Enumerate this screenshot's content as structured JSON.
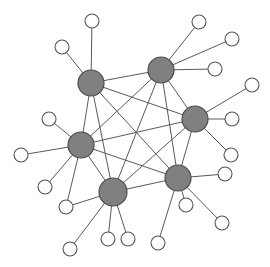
{
  "figure": {
    "title": "",
    "type": "network-graph",
    "width": 270,
    "height": 267,
    "background_color": "#ffffff"
  },
  "style": {
    "hub_fill": "#808080",
    "hub_stroke": "#4d4d4d",
    "hub_stroke_width": 1.2,
    "hub_radius": 13,
    "leaf_fill": "#ffffff",
    "leaf_stroke": "#555555",
    "leaf_stroke_width": 1.1,
    "leaf_radius": 7,
    "edge_color": "#595959",
    "edge_width": 1
  },
  "chart_data": {
    "type": "network",
    "title": "",
    "xlabel": "",
    "ylabel": "",
    "grid": false,
    "legend": "none",
    "xlim": [
      0,
      270
    ],
    "ylim": [
      0,
      267
    ],
    "node_count": 25,
    "hub_count": 6,
    "leaf_count": 19,
    "nodes": [
      {
        "id": "H1",
        "kind": "hub",
        "x": 91,
        "y": 83,
        "r": 13
      },
      {
        "id": "H2",
        "kind": "hub",
        "x": 161,
        "y": 70,
        "r": 13
      },
      {
        "id": "H3",
        "kind": "hub",
        "x": 195,
        "y": 119,
        "r": 13
      },
      {
        "id": "H4",
        "kind": "hub",
        "x": 81,
        "y": 145,
        "r": 13
      },
      {
        "id": "H5",
        "kind": "hub",
        "x": 113,
        "y": 192,
        "r": 14
      },
      {
        "id": "H6",
        "kind": "hub",
        "x": 178,
        "y": 178,
        "r": 13
      },
      {
        "id": "L1",
        "kind": "leaf",
        "x": 92,
        "y": 21,
        "r": 7
      },
      {
        "id": "L2",
        "kind": "leaf",
        "x": 62,
        "y": 47,
        "r": 7
      },
      {
        "id": "L3",
        "kind": "leaf",
        "x": 199,
        "y": 22,
        "r": 7
      },
      {
        "id": "L4",
        "kind": "leaf",
        "x": 232,
        "y": 39,
        "r": 7
      },
      {
        "id": "L5",
        "kind": "leaf",
        "x": 215,
        "y": 69,
        "r": 7
      },
      {
        "id": "L6",
        "kind": "leaf",
        "x": 252,
        "y": 85,
        "r": 7
      },
      {
        "id": "L7",
        "kind": "leaf",
        "x": 232,
        "y": 119,
        "r": 7
      },
      {
        "id": "L8",
        "kind": "leaf",
        "x": 231,
        "y": 155,
        "r": 7
      },
      {
        "id": "L9",
        "kind": "leaf",
        "x": 225,
        "y": 174,
        "r": 7
      },
      {
        "id": "L10",
        "kind": "leaf",
        "x": 222,
        "y": 223,
        "r": 7
      },
      {
        "id": "L11",
        "kind": "leaf",
        "x": 158,
        "y": 243,
        "r": 7
      },
      {
        "id": "L12",
        "kind": "leaf",
        "x": 128,
        "y": 239,
        "r": 7
      },
      {
        "id": "L13",
        "kind": "leaf",
        "x": 108,
        "y": 239,
        "r": 7
      },
      {
        "id": "L14",
        "kind": "leaf",
        "x": 70,
        "y": 249,
        "r": 7
      },
      {
        "id": "L15",
        "kind": "leaf",
        "x": 66,
        "y": 207,
        "r": 7
      },
      {
        "id": "L16",
        "kind": "leaf",
        "x": 45,
        "y": 187,
        "r": 7
      },
      {
        "id": "L17",
        "kind": "leaf",
        "x": 21,
        "y": 155,
        "r": 7
      },
      {
        "id": "L18",
        "kind": "leaf",
        "x": 49,
        "y": 119,
        "r": 7
      },
      {
        "id": "L19",
        "kind": "leaf",
        "x": 186,
        "y": 205,
        "r": 7
      }
    ],
    "edges": [
      [
        "H1",
        "H2"
      ],
      [
        "H1",
        "H3"
      ],
      [
        "H1",
        "H4"
      ],
      [
        "H1",
        "H5"
      ],
      [
        "H1",
        "H6"
      ],
      [
        "H2",
        "H3"
      ],
      [
        "H2",
        "H4"
      ],
      [
        "H2",
        "H5"
      ],
      [
        "H2",
        "H6"
      ],
      [
        "H3",
        "H4"
      ],
      [
        "H3",
        "H5"
      ],
      [
        "H3",
        "H6"
      ],
      [
        "H4",
        "H5"
      ],
      [
        "H4",
        "H6"
      ],
      [
        "H5",
        "H6"
      ],
      [
        "H1",
        "L1"
      ],
      [
        "H1",
        "L2"
      ],
      [
        "H2",
        "L3"
      ],
      [
        "H2",
        "L4"
      ],
      [
        "H2",
        "L5"
      ],
      [
        "H3",
        "L6"
      ],
      [
        "H3",
        "L7"
      ],
      [
        "H3",
        "L8"
      ],
      [
        "H4",
        "L16"
      ],
      [
        "H4",
        "L17"
      ],
      [
        "H4",
        "L18"
      ],
      [
        "H4",
        "L15"
      ],
      [
        "H5",
        "L12"
      ],
      [
        "H5",
        "L13"
      ],
      [
        "H5",
        "L14"
      ],
      [
        "H5",
        "L15"
      ],
      [
        "H6",
        "L9"
      ],
      [
        "H6",
        "L10"
      ],
      [
        "H6",
        "L11"
      ],
      [
        "H6",
        "L19"
      ]
    ]
  }
}
